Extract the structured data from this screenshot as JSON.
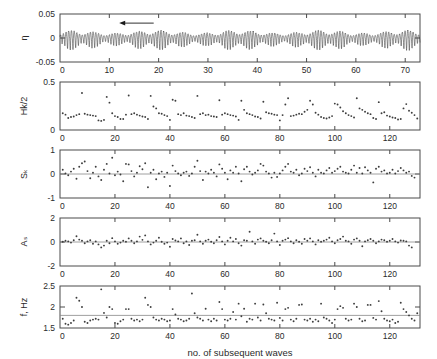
{
  "figure": {
    "xlabel": "no. of subsequent waves",
    "background": "#ffffff",
    "axis_color": "#4a4a4a",
    "marker_color": "#3d3d3d",
    "trace_color": "#3a3a3a"
  },
  "chart_data": [
    {
      "type": "line",
      "panel": 1,
      "ylabel": "η",
      "xlabel": "",
      "title": "",
      "xlim": [
        0,
        73
      ],
      "ylim": [
        -0.05,
        0.05
      ],
      "xticks": [
        0,
        10,
        20,
        30,
        40,
        50,
        60,
        70
      ],
      "xticklabels": [
        "0",
        "10",
        "20",
        "30",
        "40",
        "50",
        "60",
        "70"
      ],
      "yticks": [
        -0.05,
        0,
        0.05
      ],
      "yticklabels": [
        "-0.05",
        "0",
        "0.05"
      ],
      "grid": false,
      "annotation": {
        "type": "arrow",
        "direction": "left",
        "x_start": 19.0,
        "x_end": 12.0,
        "y": 0.031
      },
      "series_note": "free-surface elevation time series, grouped wave packets",
      "group_period": 4.55,
      "carrier_period": 0.55,
      "envelope_base": 0.0085,
      "envelope_mod": 0.0115,
      "slow_mod_period": 17.0,
      "slow_mod_amp": 0.22
    },
    {
      "type": "scatter",
      "panel": 2,
      "ylabel": "Hk/2",
      "xlabel": "",
      "xlim": [
        0,
        131
      ],
      "ylim": [
        0,
        0.5
      ],
      "xticks": [
        0,
        20,
        40,
        60,
        80,
        100,
        120
      ],
      "xticklabels": [
        "0",
        "20",
        "40",
        "60",
        "80",
        "100",
        "120"
      ],
      "yticks": [
        0,
        0.5
      ],
      "yticklabels": [
        "0",
        "0.5"
      ],
      "grid": false,
      "x": [
        1,
        2,
        3,
        4,
        5,
        6,
        7,
        8,
        9,
        10,
        11,
        12,
        13,
        14,
        15,
        16,
        17,
        18,
        19,
        20,
        21,
        22,
        23,
        24,
        25,
        26,
        27,
        28,
        29,
        30,
        31,
        32,
        33,
        34,
        35,
        36,
        37,
        38,
        39,
        40,
        41,
        42,
        43,
        44,
        45,
        46,
        47,
        48,
        49,
        50,
        51,
        52,
        53,
        54,
        55,
        56,
        57,
        58,
        59,
        60,
        61,
        62,
        63,
        64,
        65,
        66,
        67,
        68,
        69,
        70,
        71,
        72,
        73,
        74,
        75,
        76,
        77,
        78,
        79,
        80,
        81,
        82,
        83,
        84,
        85,
        86,
        87,
        88,
        89,
        90,
        91,
        92,
        93,
        94,
        95,
        96,
        97,
        98,
        99,
        100,
        101,
        102,
        103,
        104,
        105,
        106,
        107,
        108,
        109,
        110,
        111,
        112,
        113,
        114,
        115,
        116,
        117,
        118,
        119,
        120,
        121,
        122,
        123,
        124,
        125,
        126,
        127,
        128,
        129,
        130
      ],
      "values": [
        0.175,
        0.16,
        0.125,
        0.135,
        0.14,
        0.155,
        0.165,
        0.385,
        0.17,
        0.16,
        0.155,
        0.15,
        0.145,
        0.1,
        0.095,
        0.105,
        0.345,
        0.285,
        0.175,
        0.145,
        0.135,
        0.115,
        0.115,
        0.16,
        0.36,
        0.165,
        0.175,
        0.16,
        0.15,
        0.14,
        0.135,
        0.115,
        0.355,
        0.245,
        0.225,
        0.175,
        0.17,
        0.155,
        0.145,
        0.105,
        0.315,
        0.305,
        0.165,
        0.155,
        0.175,
        0.15,
        0.145,
        0.135,
        0.125,
        0.355,
        0.165,
        0.175,
        0.155,
        0.16,
        0.145,
        0.14,
        0.135,
        0.31,
        0.16,
        0.175,
        0.165,
        0.155,
        0.15,
        0.14,
        0.105,
        0.305,
        0.21,
        0.175,
        0.165,
        0.155,
        0.14,
        0.135,
        0.12,
        0.295,
        0.185,
        0.175,
        0.17,
        0.16,
        0.155,
        0.1,
        0.155,
        0.265,
        0.33,
        0.145,
        0.15,
        0.16,
        0.17,
        0.165,
        0.19,
        0.21,
        0.305,
        0.265,
        0.18,
        0.16,
        0.135,
        0.125,
        0.12,
        0.13,
        0.145,
        0.275,
        0.265,
        0.235,
        0.195,
        0.175,
        0.155,
        0.145,
        0.13,
        0.33,
        0.225,
        0.21,
        0.19,
        0.175,
        0.165,
        0.125,
        0.115,
        0.29,
        0.175,
        0.185,
        0.15,
        0.14,
        0.13,
        0.125,
        0.11,
        0.115,
        0.225,
        0.27,
        0.2,
        0.18,
        0.155,
        0.12,
        0.09
      ]
    },
    {
      "type": "scatter",
      "panel": 3,
      "ylabel": "Sₖ",
      "xlabel": "",
      "xlim": [
        0,
        131
      ],
      "ylim": [
        -1,
        1
      ],
      "xticks": [
        0,
        20,
        40,
        60,
        80,
        100,
        120
      ],
      "xticklabels": [
        "0",
        "20",
        "40",
        "60",
        "80",
        "100",
        "120"
      ],
      "yticks": [
        -1,
        0,
        1
      ],
      "yticklabels": [
        "-1",
        "0",
        "1"
      ],
      "grid": false,
      "reference_line": 0,
      "x": [
        1,
        2,
        3,
        4,
        5,
        6,
        7,
        8,
        9,
        10,
        11,
        12,
        13,
        14,
        15,
        16,
        17,
        18,
        19,
        20,
        21,
        22,
        23,
        24,
        25,
        26,
        27,
        28,
        29,
        30,
        31,
        32,
        33,
        34,
        35,
        36,
        37,
        38,
        39,
        40,
        41,
        42,
        43,
        44,
        45,
        46,
        47,
        48,
        49,
        50,
        51,
        52,
        53,
        54,
        55,
        56,
        57,
        58,
        59,
        60,
        61,
        62,
        63,
        64,
        65,
        66,
        67,
        68,
        69,
        70,
        71,
        72,
        73,
        74,
        75,
        76,
        77,
        78,
        79,
        80,
        81,
        82,
        83,
        84,
        85,
        86,
        87,
        88,
        89,
        90,
        91,
        92,
        93,
        94,
        95,
        96,
        97,
        98,
        99,
        100,
        101,
        102,
        103,
        104,
        105,
        106,
        107,
        108,
        109,
        110,
        111,
        112,
        113,
        114,
        115,
        116,
        117,
        118,
        119,
        120,
        121,
        122,
        123,
        124,
        125,
        126,
        127,
        128,
        129,
        130
      ],
      "values": [
        0.18,
        0.02,
        -0.05,
        0.1,
        0.22,
        -0.2,
        0.3,
        0.45,
        0.52,
        0.12,
        -0.18,
        0.05,
        0.3,
        -0.1,
        -0.25,
        0.18,
        0.42,
        0.02,
        0.68,
        -0.05,
        0.1,
        -0.02,
        -0.3,
        0.42,
        0.4,
        0.12,
        -0.1,
        0.05,
        0.32,
        0.2,
        0.45,
        -0.55,
        0.05,
        0.18,
        -0.22,
        0.02,
        0.1,
        -0.12,
        0.05,
        -0.5,
        0.35,
        0.12,
        0.02,
        -0.05,
        0.05,
        0.1,
        -0.08,
        0.02,
        0.3,
        0.55,
        0.12,
        -0.25,
        0.1,
        0.02,
        0.18,
        0.05,
        -0.1,
        0.4,
        0.22,
        0.05,
        -0.22,
        0.15,
        0.05,
        0.3,
        0.02,
        -0.3,
        0.2,
        0.3,
        0.1,
        -0.02,
        0.05,
        0.15,
        0.42,
        0.35,
        0.1,
        0.02,
        -0.15,
        0.05,
        -0.12,
        0.02,
        0.15,
        0.3,
        0.42,
        0.1,
        0.05,
        0.18,
        -0.05,
        0.02,
        0.22,
        0.12,
        0.28,
        0.05,
        -0.1,
        0.18,
        0.05,
        0.02,
        0.15,
        0.25,
        0.05,
        0.12,
        0.22,
        0.3,
        0.1,
        0.05,
        0.02,
        0.18,
        0.35,
        0.05,
        0.25,
        0.02,
        0.28,
        0.15,
        0.05,
        -0.35,
        0.22,
        0.3,
        0.1,
        0.15,
        0.02,
        0.05,
        0.18,
        0.02,
        0.12,
        0.25,
        0.15,
        0.05,
        0.1,
        -0.08,
        -0.15
      ]
    },
    {
      "type": "scatter",
      "panel": 4,
      "ylabel": "Aₛ",
      "xlabel": "",
      "xlim": [
        0,
        131
      ],
      "ylim": [
        -2,
        2
      ],
      "xticks": [
        0,
        20,
        40,
        60,
        80,
        100,
        120
      ],
      "xticklabels": [
        "0",
        "20",
        "40",
        "60",
        "80",
        "100",
        "120"
      ],
      "yticks": [
        -2,
        0,
        2
      ],
      "yticklabels": [
        "-2",
        "0",
        "2"
      ],
      "grid": false,
      "reference_line": 0,
      "x": [
        1,
        2,
        3,
        4,
        5,
        6,
        7,
        8,
        9,
        10,
        11,
        12,
        13,
        14,
        15,
        16,
        17,
        18,
        19,
        20,
        21,
        22,
        23,
        24,
        25,
        26,
        27,
        28,
        29,
        30,
        31,
        32,
        33,
        34,
        35,
        36,
        37,
        38,
        39,
        40,
        41,
        42,
        43,
        44,
        45,
        46,
        47,
        48,
        49,
        50,
        51,
        52,
        53,
        54,
        55,
        56,
        57,
        58,
        59,
        60,
        61,
        62,
        63,
        64,
        65,
        66,
        67,
        68,
        69,
        70,
        71,
        72,
        73,
        74,
        75,
        76,
        77,
        78,
        79,
        80,
        81,
        82,
        83,
        84,
        85,
        86,
        87,
        88,
        89,
        90,
        91,
        92,
        93,
        94,
        95,
        96,
        97,
        98,
        99,
        100,
        101,
        102,
        103,
        104,
        105,
        106,
        107,
        108,
        109,
        110,
        111,
        112,
        113,
        114,
        115,
        116,
        117,
        118,
        119,
        120,
        121,
        122,
        123,
        124,
        125,
        126,
        127,
        128,
        129,
        130
      ],
      "values": [
        0.02,
        0.1,
        0.05,
        -0.05,
        0.15,
        0.48,
        0.2,
        0.1,
        -0.1,
        0.05,
        0.15,
        -0.15,
        0.05,
        -0.2,
        -0.45,
        -0.3,
        0.1,
        -0.1,
        0.32,
        0.05,
        -0.15,
        -0.05,
        0.1,
        0.02,
        0.3,
        0.1,
        -0.1,
        0.05,
        0.45,
        0.18,
        0.55,
        0.05,
        -0.2,
        -0.05,
        0.1,
        0.35,
        0.02,
        -0.15,
        -0.05,
        -0.4,
        0.25,
        0.12,
        0.05,
        0.3,
        -0.1,
        0.05,
        -0.25,
        0.1,
        0.15,
        0.6,
        0.05,
        -0.15,
        0.1,
        0.2,
        0.02,
        -0.1,
        0.15,
        0.42,
        0.05,
        -0.2,
        0.1,
        0.35,
        0.05,
        0.25,
        -0.1,
        -0.3,
        0.15,
        0.1,
        0.85,
        0.05,
        -0.15,
        0.2,
        0.3,
        0.1,
        0.02,
        -0.1,
        0.15,
        0.7,
        0.05,
        -0.25,
        0.1,
        0.2,
        0.32,
        0.05,
        -0.1,
        0.15,
        0.02,
        -0.15,
        0.25,
        0.1,
        0.3,
        0.05,
        -0.2,
        0.15,
        0.02,
        0.1,
        0.2,
        0.35,
        0.05,
        -0.1,
        0.15,
        0.25,
        0.45,
        0.1,
        0.05,
        -0.15,
        0.2,
        0.3,
        0.1,
        -0.35,
        0.05,
        0.15,
        0.25,
        0.1,
        -0.1,
        0.05,
        0.2,
        0.15,
        0.02,
        0.1,
        0.25,
        0.05,
        -0.05,
        0.12,
        0.1,
        0.05,
        -0.3,
        -0.45
      ]
    },
    {
      "type": "scatter",
      "panel": 5,
      "ylabel": "f, Hz",
      "xlabel": "no. of subsequent waves",
      "xlim": [
        0,
        131
      ],
      "ylim": [
        1.5,
        2.5
      ],
      "xticks": [
        0,
        20,
        40,
        60,
        80,
        100,
        120
      ],
      "xticklabels": [
        "0",
        "20",
        "40",
        "60",
        "80",
        "100",
        "120"
      ],
      "yticks": [
        1.5,
        2,
        2.5
      ],
      "yticklabels": [
        "1.5",
        "2",
        "2.5"
      ],
      "grid": false,
      "reference_line": 1.8,
      "x": [
        1,
        2,
        3,
        4,
        5,
        6,
        7,
        8,
        9,
        10,
        11,
        12,
        13,
        14,
        15,
        16,
        17,
        18,
        19,
        20,
        21,
        22,
        23,
        24,
        25,
        26,
        27,
        28,
        29,
        30,
        31,
        32,
        33,
        34,
        35,
        36,
        37,
        38,
        39,
        40,
        41,
        42,
        43,
        44,
        45,
        46,
        47,
        48,
        49,
        50,
        51,
        52,
        53,
        54,
        55,
        56,
        57,
        58,
        59,
        60,
        61,
        62,
        63,
        64,
        65,
        66,
        67,
        68,
        69,
        70,
        71,
        72,
        73,
        74,
        75,
        76,
        77,
        78,
        79,
        80,
        81,
        82,
        83,
        84,
        85,
        86,
        87,
        88,
        89,
        90,
        91,
        92,
        93,
        94,
        95,
        96,
        97,
        98,
        99,
        100,
        101,
        102,
        103,
        104,
        105,
        106,
        107,
        108,
        109,
        110,
        111,
        112,
        113,
        114,
        115,
        116,
        117,
        118,
        119,
        120,
        121,
        122,
        123,
        124,
        125,
        126,
        127,
        128,
        129,
        130
      ],
      "values": [
        1.72,
        1.6,
        1.58,
        1.62,
        1.68,
        2.22,
        2.15,
        2.0,
        1.65,
        1.62,
        1.68,
        1.7,
        1.72,
        1.7,
        2.42,
        1.86,
        1.75,
        2.0,
        1.95,
        1.62,
        1.6,
        1.66,
        1.7,
        1.95,
        1.95,
        1.72,
        1.68,
        1.7,
        1.66,
        1.7,
        2.22,
        2.05,
        2.0,
        1.75,
        1.7,
        1.68,
        1.72,
        1.7,
        1.66,
        1.68,
        1.95,
        1.82,
        1.72,
        1.7,
        1.66,
        1.68,
        1.72,
        2.32,
        1.85,
        1.75,
        1.72,
        1.68,
        1.96,
        1.7,
        1.66,
        1.72,
        1.68,
        2.12,
        1.95,
        1.7,
        1.68,
        1.72,
        1.88,
        1.7,
        2.08,
        1.78,
        1.96,
        1.65,
        1.72,
        1.7,
        2.08,
        1.75,
        1.68,
        2.06,
        1.85,
        1.72,
        1.7,
        1.68,
        2.1,
        1.74,
        1.68,
        1.95,
        1.98,
        1.7,
        1.66,
        1.72,
        2.05,
        2.06,
        1.7,
        1.68,
        1.72,
        1.65,
        1.7,
        1.66,
        2.08,
        1.75,
        1.72,
        1.68,
        1.62,
        1.7,
        1.95,
        2.02,
        1.98,
        1.72,
        1.68,
        1.7,
        2.08,
        2.0,
        1.72,
        1.66,
        1.68,
        2.05,
        2.05,
        1.74,
        1.7,
        2.14,
        1.9,
        1.72,
        1.68,
        1.66,
        1.7,
        1.62,
        1.65,
        2.1,
        1.95,
        1.88,
        1.8,
        1.72,
        1.68,
        1.85
      ]
    }
  ]
}
